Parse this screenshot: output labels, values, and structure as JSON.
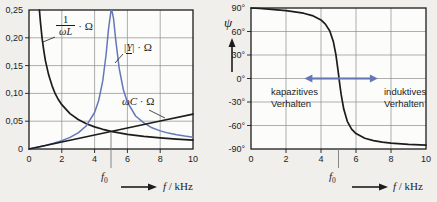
{
  "figure": {
    "description_colors": {
      "curve_black": "#1c1c1c",
      "curve_blue": "#6677b8",
      "grid": "#8c8c8c",
      "marker": "#7a7a7a"
    }
  },
  "chart_data": [
    {
      "type": "line",
      "title": "",
      "xlabel": "f / kHz",
      "ylabel": "",
      "xlim": [
        0,
        10
      ],
      "ylim": [
        0,
        0.25
      ],
      "x_ticks": [
        0,
        2,
        4,
        6,
        8,
        10
      ],
      "x_tick_labels": [
        "0",
        "2",
        "4",
        "6",
        "8",
        "10"
      ],
      "y_ticks": [
        0,
        0.05,
        0.1,
        0.15,
        0.2,
        0.25
      ],
      "y_tick_labels": [
        "0",
        "0,05",
        "0,10",
        "0,15",
        "0,20",
        "0,25"
      ],
      "grid": true,
      "legend_position": "none",
      "resonance_f0_kHz": 5,
      "series": [
        {
          "name": "1/(omegaL)*Ohm",
          "color": "#1c1c1c",
          "points": [
            [
              0.6366,
              0.25
            ],
            [
              0.7,
              0.227
            ],
            [
              0.8,
              0.199
            ],
            [
              0.9,
              0.177
            ],
            [
              1.0,
              0.159
            ],
            [
              1.2,
              0.133
            ],
            [
              1.4,
              0.114
            ],
            [
              1.6,
              0.0995
            ],
            [
              1.8,
              0.0884
            ],
            [
              2.0,
              0.0796
            ],
            [
              2.5,
              0.0637
            ],
            [
              3,
              0.0531
            ],
            [
              3.5,
              0.0455
            ],
            [
              4,
              0.0398
            ],
            [
              4.5,
              0.0354
            ],
            [
              5,
              0.0318
            ],
            [
              5.5,
              0.0289
            ],
            [
              6,
              0.0265
            ],
            [
              7,
              0.0227
            ],
            [
              8,
              0.0199
            ],
            [
              9,
              0.0177
            ],
            [
              10,
              0.0159
            ]
          ]
        },
        {
          "name": "abs(Y)*Ohm",
          "color": "#6677b8",
          "points": [
            [
              0,
              0
            ],
            [
              0.5,
              0.003
            ],
            [
              1,
              0.0065
            ],
            [
              1.5,
              0.0103
            ],
            [
              2,
              0.0149
            ],
            [
              2.5,
              0.0208
            ],
            [
              3,
              0.029
            ],
            [
              3.5,
              0.0419
            ],
            [
              4,
              0.0657
            ],
            [
              4.25,
              0.0872
            ],
            [
              4.5,
              0.1228
            ],
            [
              4.7,
              0.17
            ],
            [
              4.85,
              0.2156
            ],
            [
              5.0,
              0.2487
            ],
            [
              5.05,
              0.25
            ],
            [
              5.15,
              0.235
            ],
            [
              5.3,
              0.1936
            ],
            [
              5.5,
              0.145
            ],
            [
              5.75,
              0.107
            ],
            [
              6,
              0.0842
            ],
            [
              6.5,
              0.0594
            ],
            [
              7,
              0.0469
            ],
            [
              7.5,
              0.0382
            ],
            [
              8,
              0.0326
            ],
            [
              8.5,
              0.0286
            ],
            [
              9,
              0.0256
            ],
            [
              9.5,
              0.0232
            ],
            [
              10,
              0.0213
            ]
          ]
        },
        {
          "name": "omegaC*Ohm",
          "color": "#1c1c1c",
          "points": [
            [
              0,
              0
            ],
            [
              2,
              0.0126
            ],
            [
              4,
              0.0251
            ],
            [
              6,
              0.0377
            ],
            [
              8,
              0.0503
            ],
            [
              10,
              0.0628
            ]
          ]
        }
      ],
      "annotations": {
        "curve1_label": {
          "num": "1",
          "den": "ωL",
          "unit": "· Ω"
        },
        "curve2_label": {
          "open": "|",
          "sym": "Y",
          "close": "|",
          "unit": "· Ω"
        },
        "curve3_label": {
          "sym": "ωC",
          "unit": "· Ω"
        },
        "f0": {
          "sym": "f",
          "sub": "0"
        },
        "xaxis": {
          "sym": "f",
          "unit": "/ kHz"
        }
      }
    },
    {
      "type": "line",
      "title": "",
      "xlabel": "f / kHz",
      "ylabel": "ψ",
      "xlim": [
        0,
        10
      ],
      "ylim": [
        -90,
        90
      ],
      "x_ticks": [
        0,
        2,
        4,
        6,
        8,
        10
      ],
      "x_tick_labels": [
        "0",
        "2",
        "4",
        "6",
        "8",
        "10"
      ],
      "y_ticks": [
        90,
        60,
        30,
        0,
        -30,
        -60,
        -90
      ],
      "y_tick_labels": [
        "90°",
        "60°",
        "30°",
        "0°",
        "-30°",
        "-60°",
        "-90°"
      ],
      "grid": true,
      "legend_position": "none",
      "resonance_f0_kHz": 5,
      "series": [
        {
          "name": "psi(f)",
          "color": "#1c1c1c",
          "points": [
            [
              0,
              90
            ],
            [
              0.5,
              89.3
            ],
            [
              1,
              88.5
            ],
            [
              1.5,
              87.6
            ],
            [
              2,
              86.6
            ],
            [
              2.5,
              85.2
            ],
            [
              3,
              83.3
            ],
            [
              3.5,
              80.3
            ],
            [
              4,
              74.8
            ],
            [
              4.25,
              69.5
            ],
            [
              4.5,
              60.6
            ],
            [
              4.7,
              47.3
            ],
            [
              4.85,
              30.4
            ],
            [
              5.0,
              5.9
            ],
            [
              5.03,
              0
            ],
            [
              5.15,
              -20.1
            ],
            [
              5.3,
              -39.3
            ],
            [
              5.5,
              -54.6
            ],
            [
              5.75,
              -64.7
            ],
            [
              6,
              -70.3
            ],
            [
              6.5,
              -76.3
            ],
            [
              7,
              -79.3
            ],
            [
              7.5,
              -81.2
            ],
            [
              8,
              -82.5
            ],
            [
              9,
              -84.1
            ],
            [
              10,
              -85.1
            ]
          ]
        }
      ],
      "annotations": {
        "ylabel": "ψ",
        "region_left_line1": "kapazitives",
        "region_left_line2": "Verhalten",
        "region_right_line1": "induktives",
        "region_right_line2": "Verhalten",
        "double_arrow": {
          "x1_kHz": 3.05,
          "x2_kHz": 7.25,
          "y_deg": 0,
          "color": "#6677b8"
        },
        "f0": {
          "sym": "f",
          "sub": "0"
        },
        "xaxis": {
          "sym": "f",
          "unit": "/ kHz"
        }
      }
    }
  ]
}
